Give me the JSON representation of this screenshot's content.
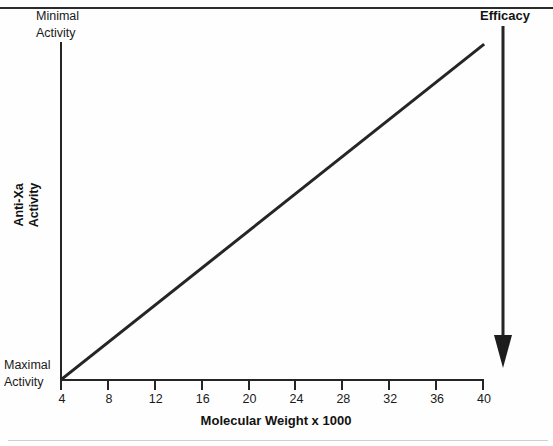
{
  "figure": {
    "background_color": "#fefefe",
    "line_color": "#252525",
    "top_rule": "horizontal-rule",
    "bottom_rule": "horizontal-rule"
  },
  "annotations": {
    "top_left_label": "Minimal\nActivity",
    "bottom_left_label": "Maximal\nActivity",
    "efficacy_label": "Efficacy",
    "efficacy_arrow": "down-arrow"
  },
  "chart_data": {
    "type": "line",
    "title": "",
    "subtitle": "",
    "xlabel": "Molecular Weight x 1000",
    "ylabel": "Anti-Xa Activity",
    "xlim": [
      4,
      40
    ],
    "ylim": [
      0,
      1
    ],
    "grid": false,
    "legend": null,
    "xticks": [
      4,
      8,
      12,
      16,
      20,
      24,
      28,
      32,
      36,
      40
    ],
    "xtick_labels": [
      "4",
      "8",
      "12",
      "16",
      "20",
      "24",
      "28",
      "32",
      "36",
      "40"
    ],
    "yticks": [],
    "ytick_labels": [
      "Maximal Activity",
      "Minimal Activity"
    ],
    "y_axis_note": "Unnumbered axis: bottom = Maximal Activity, top = Minimal Activity",
    "series": [
      {
        "name": "Anti-Xa Activity",
        "x": [
          4,
          40
        ],
        "y": [
          0,
          1
        ],
        "style": "straight-line",
        "color": "#252525",
        "width": 3
      }
    ],
    "annotations": [
      {
        "text": "Efficacy",
        "type": "arrow",
        "direction": "down",
        "x": 40,
        "note": "Bold label with long downward arrow at right edge"
      },
      {
        "text": "Minimal Activity",
        "type": "axis-end-label",
        "position": "y-top"
      },
      {
        "text": "Maximal Activity",
        "type": "axis-end-label",
        "position": "y-bottom"
      }
    ]
  }
}
